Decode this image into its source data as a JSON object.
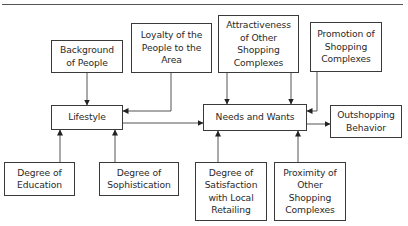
{
  "diagram": {
    "nodes": {
      "background": {
        "label": "Background\nof People"
      },
      "loyalty": {
        "label": "Loyalty of the\nPeople to the\nArea"
      },
      "attractiveness": {
        "label": "Attractiveness\nof Other\nShopping\nComplexes"
      },
      "promotion": {
        "label": "Promotion of\nShopping\nComplexes"
      },
      "lifestyle": {
        "label": "Lifestyle"
      },
      "needs": {
        "label": "Needs and Wants"
      },
      "outshopping": {
        "label": "Outshopping\nBehavior"
      },
      "education": {
        "label": "Degree of\nEducation"
      },
      "sophistication": {
        "label": "Degree of\nSophistication"
      },
      "satisfaction": {
        "label": "Degree of\nSatisfaction\nwith Local\nRetailing"
      },
      "proximity": {
        "label": "Proximity of\nOther\nShopping\nComplexes"
      }
    },
    "edges": [
      {
        "from": "background",
        "to": "lifestyle"
      },
      {
        "from": "loyalty",
        "to": "lifestyle"
      },
      {
        "from": "education",
        "to": "lifestyle"
      },
      {
        "from": "sophistication",
        "to": "lifestyle"
      },
      {
        "from": "lifestyle",
        "to": "needs"
      },
      {
        "from": "attractiveness",
        "to": "needs"
      },
      {
        "from": "attractiveness",
        "to": "needs"
      },
      {
        "from": "promotion",
        "to": "needs"
      },
      {
        "from": "satisfaction",
        "to": "needs"
      },
      {
        "from": "proximity",
        "to": "needs"
      },
      {
        "from": "needs",
        "to": "outshopping"
      }
    ]
  }
}
